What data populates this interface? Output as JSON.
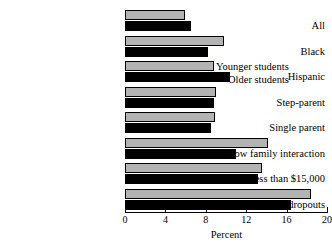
{
  "chart_data": {
    "type": "bar",
    "orientation": "horizontal",
    "title": "",
    "xlabel": "Percent",
    "ylabel": "",
    "xlim": [
      0,
      20
    ],
    "xticks": [
      0,
      4,
      8,
      12,
      16,
      20
    ],
    "grid": false,
    "legend_position": "inside-upper-right",
    "categories": [
      "All",
      "Black",
      "Hispanic",
      "Step-parent",
      "Single parent",
      "Low family interaction",
      "Income less than $15,000",
      "Parents are dropouts"
    ],
    "series": [
      {
        "name": "Younger students",
        "color": "#b3b3b3",
        "values": [
          5.9,
          9.8,
          8.8,
          9.0,
          8.9,
          14.2,
          13.6,
          18.4
        ]
      },
      {
        "name": "Older students",
        "color": "#000000",
        "values": [
          6.5,
          8.2,
          10.4,
          8.8,
          8.5,
          11.0,
          13.2,
          16.4
        ]
      }
    ]
  },
  "legend": {
    "younger_label": "Younger students",
    "older_label": "Older students"
  },
  "axis": {
    "tick_labels": [
      "0",
      "4",
      "8",
      "12",
      "16",
      "20"
    ],
    "x_axis_title": "Percent"
  }
}
